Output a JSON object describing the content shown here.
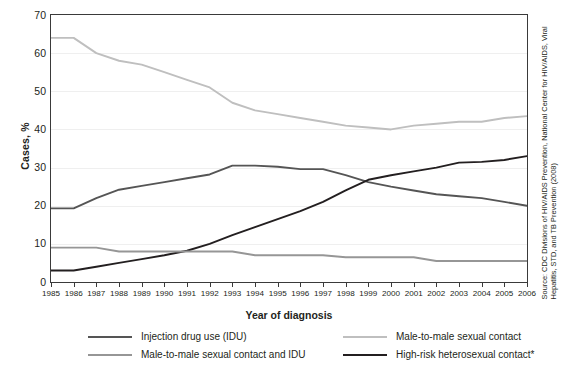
{
  "chart_data": {
    "type": "line",
    "title": "",
    "xlabel": "Year of diagnosis",
    "ylabel": "Cases, %",
    "ylim": [
      0,
      70
    ],
    "ytick_step": 10,
    "yticks": [
      "70",
      "60",
      "50",
      "40",
      "30",
      "20",
      "10",
      "0"
    ],
    "grid": true,
    "grid_axis": "y",
    "legend_position": "bottom",
    "categories": [
      "1985",
      "1986",
      "1987",
      "1988",
      "1989",
      "1990",
      "1991",
      "1992",
      "1993",
      "1994",
      "1995",
      "1996",
      "1997",
      "1998",
      "1999",
      "2000",
      "2001",
      "2002",
      "2003",
      "2004",
      "2005",
      "2006"
    ],
    "series": [
      {
        "name": "Male-to-male sexual contact",
        "color": "#bfbfbf",
        "values": [
          64,
          64,
          60,
          58,
          57,
          55,
          53,
          51,
          47,
          45,
          44,
          43,
          42,
          41,
          40.5,
          40,
          41,
          41.5,
          42,
          42,
          43,
          43.5
        ]
      },
      {
        "name": "Injection drug use (IDU)",
        "color": "#555555",
        "values": [
          19.3,
          19.3,
          22,
          24.2,
          25.2,
          26.2,
          27.2,
          28.2,
          30.5,
          30.5,
          30.2,
          29.6,
          29.6,
          28,
          26.2,
          25,
          24,
          23,
          22.5,
          22,
          21,
          20
        ]
      },
      {
        "name": "High-risk heterosexual contact*",
        "color": "#231f20",
        "values": [
          3,
          3,
          4,
          5,
          6,
          7,
          8.2,
          10,
          12.3,
          14.4,
          16.5,
          18.6,
          21,
          24,
          26.8,
          28,
          29,
          30,
          31.3,
          31.5,
          32,
          33
        ]
      },
      {
        "name": "Male-to-male sexual contact and IDU",
        "color": "#969696",
        "values": [
          9,
          9,
          9,
          8,
          8,
          8,
          8,
          8,
          8,
          7,
          7,
          7,
          7,
          6.5,
          6.5,
          6.5,
          6.5,
          5.5,
          5.5,
          5.5,
          5.5,
          5.5
        ]
      }
    ],
    "source": "Source: CDC Divisions of HIV/AIDS Prevention, National Center for HIV/AIDS, Viral Hepatitis, STD, and TB Prevention (2008)"
  },
  "legend": {
    "items": [
      {
        "label": "Injection drug use (IDU)",
        "color": "#555555"
      },
      {
        "label": "Male-to-male sexual contact and IDU",
        "color": "#969696"
      },
      {
        "label": "Male-to-male sexual contact",
        "color": "#bfbfbf"
      },
      {
        "label": "High-risk heterosexual contact*",
        "color": "#231f20"
      }
    ]
  }
}
